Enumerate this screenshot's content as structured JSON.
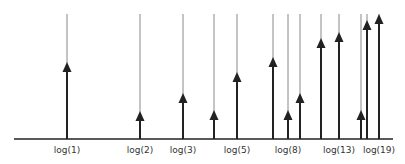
{
  "diagram": {
    "title": "",
    "baseline_y": 139,
    "line_top_y": 14,
    "colors": {
      "thin_line": "#888888",
      "arrow": "#222222",
      "axis": "#222222",
      "label": "#333333"
    },
    "markers": [
      {
        "x": 67,
        "tip_y": 62,
        "label": "log(1)"
      },
      {
        "x": 140,
        "tip_y": 111,
        "label": "log(2)"
      },
      {
        "x": 183,
        "tip_y": 93,
        "label": "log(3)"
      },
      {
        "x": 214,
        "tip_y": 110,
        "label": ""
      },
      {
        "x": 237,
        "tip_y": 72,
        "label": "log(5)"
      },
      {
        "x": 273,
        "tip_y": 57,
        "label": ""
      },
      {
        "x": 288,
        "tip_y": 110,
        "label": "log(8)"
      },
      {
        "x": 300,
        "tip_y": 93,
        "label": ""
      },
      {
        "x": 321,
        "tip_y": 38,
        "label": ""
      },
      {
        "x": 339,
        "tip_y": 32,
        "label": "log(13)"
      },
      {
        "x": 361,
        "tip_y": 110,
        "label": ""
      },
      {
        "x": 367,
        "tip_y": 20,
        "label": ""
      },
      {
        "x": 379,
        "tip_y": 14,
        "label": "log(19)"
      }
    ]
  }
}
